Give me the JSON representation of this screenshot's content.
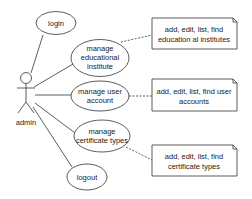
{
  "diagram": {
    "type": "use-case",
    "actor": {
      "label": "admin"
    },
    "use_cases": [
      {
        "id": "login",
        "lines": [
          "login"
        ]
      },
      {
        "id": "manage-educational-institute",
        "lines": [
          "manage",
          "educational",
          "institute"
        ]
      },
      {
        "id": "manage-user-account",
        "lines": [
          "manage user",
          "account"
        ]
      },
      {
        "id": "manage-certificate-types",
        "lines": [
          "manage",
          "certificate types"
        ]
      },
      {
        "id": "logout",
        "lines": [
          "logout"
        ]
      }
    ],
    "notes": [
      {
        "attached_to": "manage-educational-institute",
        "lines": [
          "add, edit, list, find",
          "education al institutes"
        ]
      },
      {
        "attached_to": "manage-user-account",
        "lines": [
          "add, edit, list, find user",
          "accounts"
        ]
      },
      {
        "attached_to": "manage-certificate-types",
        "lines": [
          "add, edit, list, find",
          "certificate types"
        ]
      }
    ],
    "colors": {
      "stroke": "#333333",
      "text": "#222222",
      "background": "#ffffff"
    }
  }
}
